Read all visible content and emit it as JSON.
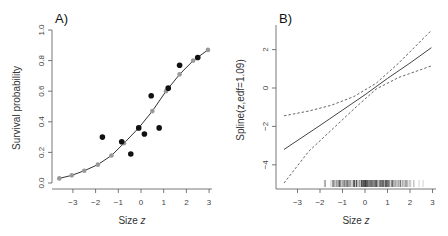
{
  "chart_data": [
    {
      "type": "scatter",
      "panel_label": "A)",
      "xlabel": "Size z",
      "ylabel": "Survival probability",
      "xlim": [
        -3.7,
        3.0
      ],
      "ylim": [
        0.0,
        1.0
      ],
      "xticks": [
        "-3",
        "-2",
        "-1",
        "0",
        "1",
        "2",
        "3"
      ],
      "yticks": [
        "0.0",
        "0.2",
        "0.4",
        "0.6",
        "0.8",
        "1.0"
      ],
      "series": [
        {
          "name": "observed",
          "style": "black filled points",
          "x": [
            -1.7,
            -0.85,
            -0.45,
            -0.1,
            0.15,
            0.45,
            0.8,
            1.2,
            1.7,
            2.5
          ],
          "y": [
            0.3,
            0.27,
            0.19,
            0.36,
            0.32,
            0.57,
            0.36,
            0.62,
            0.77,
            0.82
          ]
        },
        {
          "name": "fitted",
          "style": "grey points joined by black line",
          "x": [
            -3.6,
            -3.05,
            -2.5,
            -1.9,
            -1.3,
            -0.75,
            -0.1,
            0.5,
            1.1,
            1.7,
            2.3,
            2.95
          ],
          "y": [
            0.03,
            0.05,
            0.08,
            0.12,
            0.18,
            0.26,
            0.36,
            0.47,
            0.6,
            0.71,
            0.8,
            0.87
          ]
        }
      ]
    },
    {
      "type": "line",
      "panel_label": "B)",
      "xlabel": "Size z",
      "ylabel": "Spline(z,edf=1.09)",
      "xlim": [
        -3.7,
        3.0
      ],
      "ylim": [
        -5.2,
        3.2
      ],
      "xticks": [
        "-3",
        "-2",
        "-1",
        "0",
        "1",
        "2",
        "3"
      ],
      "yticks": [
        "-4",
        "-2",
        "0",
        "2"
      ],
      "series": [
        {
          "name": "spline estimate",
          "style": "solid",
          "x": [
            -3.6,
            -2,
            -1,
            0,
            1,
            2,
            2.95
          ],
          "y": [
            -3.2,
            -1.95,
            -1.15,
            -0.35,
            0.5,
            1.3,
            2.1
          ]
        },
        {
          "name": "upper confidence band",
          "style": "dashed",
          "x": [
            -3.6,
            -2.5,
            -1.5,
            -0.5,
            0.5,
            1.5,
            2.95
          ],
          "y": [
            -1.45,
            -1.2,
            -0.9,
            -0.45,
            0.25,
            1.3,
            3.0
          ]
        },
        {
          "name": "lower confidence band",
          "style": "dashed",
          "x": [
            -3.6,
            -2.5,
            -1.5,
            -0.5,
            0.5,
            1.5,
            2.95
          ],
          "y": [
            -4.95,
            -3.3,
            -2.2,
            -1.1,
            -0.05,
            0.55,
            1.15
          ]
        }
      ],
      "rug": "dense tick marks along bottom from about z=-2 to z=3, densest near z=-0.5 to 1"
    }
  ],
  "panels": {
    "a": {
      "label": "A)",
      "xlabel": "Size ",
      "xlabel_var": "z",
      "ylabel": "Survival probability"
    },
    "b": {
      "label": "B)",
      "xlabel": "Size ",
      "xlabel_var": "z",
      "ylabel": "Spline(z,edf=1.09)"
    }
  },
  "colors": {
    "observed": "#111111",
    "fitted": "#999999",
    "line": "#333333",
    "axis": "#555555"
  }
}
